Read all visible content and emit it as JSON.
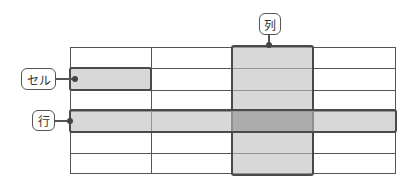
{
  "labels": {
    "cell": "セル",
    "row": "行",
    "column": "列"
  },
  "grid": {
    "rows": 6,
    "columns": 4
  },
  "colors": {
    "line": "#555555",
    "highlight_fill": "#cfcfcf",
    "intersection_fill": "#a9a9a9"
  }
}
